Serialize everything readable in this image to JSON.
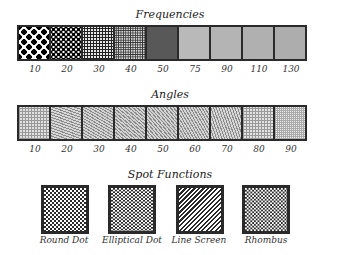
{
  "frequencies": {
    "title": "Frequencies",
    "labels": [
      "10",
      "20",
      "30",
      "40",
      "50",
      "75",
      "90",
      "110",
      "130"
    ]
  },
  "angles": {
    "title": "Angles",
    "labels": [
      "10",
      "20",
      "30",
      "40",
      "50",
      "60",
      "70",
      "80",
      "90"
    ]
  },
  "spot_functions": {
    "title": "Spot Functions",
    "items": [
      "Round Dot",
      "Elliptical Dot",
      "Line Screen",
      "Rhombus"
    ]
  },
  "colors": {
    "border": "#2a2a2a",
    "background": "#ffffff",
    "text": "#333333"
  }
}
